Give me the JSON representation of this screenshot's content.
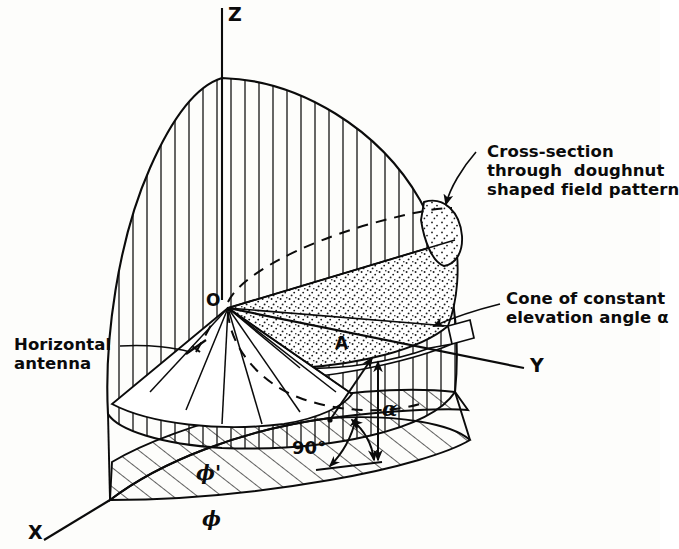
{
  "figure": {
    "type": "technical-line-diagram",
    "background_color": "#fdfdfb",
    "ink_color": "#0b0b0b"
  },
  "axes": {
    "z": {
      "label": "Z",
      "direction": "vertical-up"
    },
    "y": {
      "label": "Y",
      "direction": "right"
    },
    "x": {
      "label": "X",
      "direction": "lower-left"
    }
  },
  "points": {
    "origin": {
      "label": "O"
    },
    "cone_point": {
      "label": "A"
    }
  },
  "angles": {
    "elevation": {
      "label": "α",
      "name": "alpha"
    },
    "right_angle": {
      "label": "90°",
      "name": "ninety-degrees"
    },
    "azimuth": {
      "label": "ϕ",
      "name": "phi"
    },
    "azimuth_prime": {
      "label": "ϕ'",
      "name": "phi-prime"
    }
  },
  "annotations": [
    {
      "name": "cross-section-note",
      "lines": [
        "Cross-section",
        "through  doughnut",
        "shaped field pattern"
      ],
      "leader": "arrow-to-stippled-cap"
    },
    {
      "name": "cone-note",
      "lines": [
        "Cone of constant",
        "elevation angle α"
      ],
      "leader": "arrow-to-cone-surface"
    },
    {
      "name": "antenna-note",
      "lines": [
        "Horizontal",
        "antenna"
      ],
      "leader": "line-to-antenna-symbol"
    }
  ],
  "regions": {
    "field_lobe": {
      "name": "field-pattern-lobe",
      "fill": "vertical-hatch"
    },
    "cone_sector": {
      "name": "cone-sector",
      "fill": "stipple"
    },
    "ground_plane": {
      "name": "ground-plane-sector",
      "fill": "diagonal-hatch"
    },
    "doughnut_cap": {
      "name": "doughnut-cross-section-cap",
      "fill": "stipple"
    }
  }
}
